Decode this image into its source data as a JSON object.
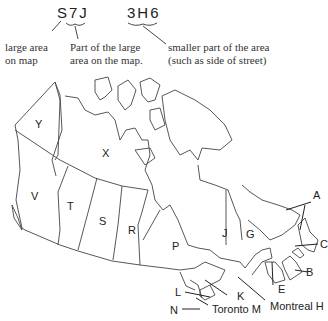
{
  "postal_code": {
    "first_part": "S7J",
    "second_part": "3H6",
    "notes": {
      "large_area": [
        "large area",
        "on map"
      ],
      "part_of_area": [
        "Part of the large",
        "area on the map."
      ],
      "smaller_part": [
        "smaller part of the area",
        "(such as side of street)"
      ]
    }
  },
  "map_labels": {
    "yukon": "Y",
    "nwt": "X",
    "bc": "V",
    "alberta": "T",
    "sask": "S",
    "manitoba": "R",
    "ontario": "P",
    "quebec": "J",
    "quebec_east": "G",
    "newfoundland": "A",
    "pei": "C",
    "nova_scotia": "B",
    "new_brunswick": "E",
    "montreal": "Montreal H",
    "toronto": "Toronto M",
    "eastern_ontario": "K",
    "central_ontario": "L",
    "southwest_ontario": "N"
  }
}
